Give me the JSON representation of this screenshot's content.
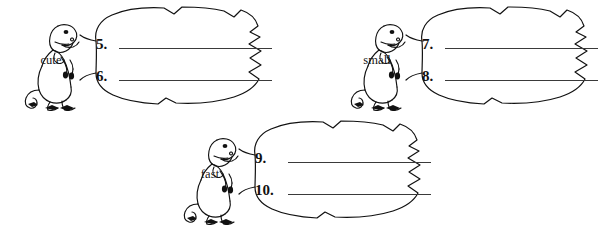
{
  "page": {
    "background_color": "#ffffff",
    "ink_color": "#1a1a1a"
  },
  "groups": [
    {
      "id": "group-cute",
      "dino_label": "cute",
      "dino_icon": "tyrannosaurus-icon",
      "bubble_icon": "torn-speech-bubble-icon",
      "items": [
        {
          "number": "5.",
          "answer": ""
        },
        {
          "number": "6.",
          "answer": ""
        }
      ]
    },
    {
      "id": "group-small",
      "dino_label": "small",
      "dino_icon": "tyrannosaurus-icon",
      "bubble_icon": "torn-speech-bubble-icon",
      "items": [
        {
          "number": "7.",
          "answer": ""
        },
        {
          "number": "8.",
          "answer": ""
        }
      ]
    },
    {
      "id": "group-fast",
      "dino_label": "fast",
      "dino_icon": "tyrannosaurus-icon",
      "bubble_icon": "torn-speech-bubble-icon",
      "items": [
        {
          "number": "9.",
          "answer": ""
        },
        {
          "number": "10.",
          "answer": ""
        }
      ]
    }
  ]
}
